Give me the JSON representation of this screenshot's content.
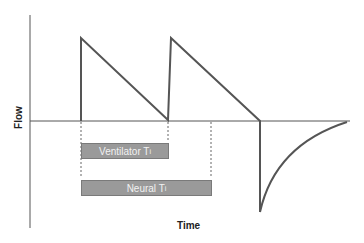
{
  "diagram": {
    "y_axis_label": "Flow",
    "x_axis_label": "Time",
    "bars": [
      {
        "label": "Ventilator T",
        "subscript": "i"
      },
      {
        "label": "Neural T",
        "subscript": "i"
      }
    ],
    "colors": {
      "line": "#555555",
      "bar_fill": "#9a9a9a",
      "bar_text": "#f2f2f2"
    }
  }
}
